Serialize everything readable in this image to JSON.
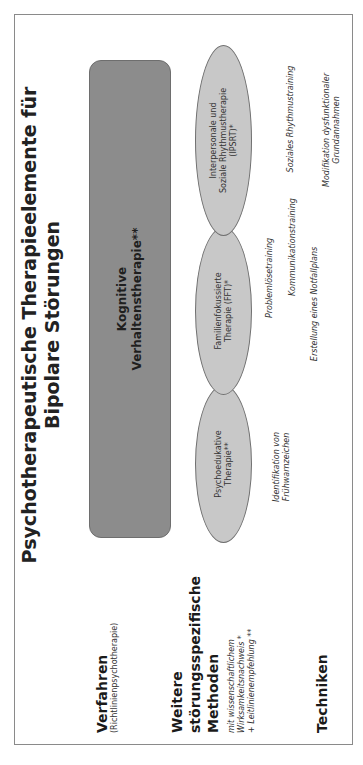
{
  "diagram": {
    "title": "Psychotherapeutische Therapieelemente für Bipolare Störungen",
    "title_lines": [
      "Psychotherapeutische Therapieelemente für",
      "Bipolare Störungen"
    ],
    "orientation": "rotated -90deg",
    "colors": {
      "frame_border": "#8a8a8a",
      "kvt_box_fill": "#8c8c8c",
      "ellipse_fill": "#c8c8c8",
      "ellipse_border": "#707070",
      "background": "#ffffff"
    },
    "row_labels": {
      "verfahren": {
        "label": "Verfahren",
        "sublabel": "(Richtlinienpsychotherapie)"
      },
      "methoden": {
        "label_lines": [
          "Weitere",
          "störungsspezifische",
          "Methoden"
        ],
        "sublabel_lines": [
          "mit wissenschaftlichem",
          "Wirksamkeitsnachweis *",
          "+ Leitlinienempfehlung **"
        ]
      },
      "techniken": {
        "label": "Techniken"
      }
    },
    "verfahren_box": {
      "lines": [
        "Kognitive",
        "Verhaltenstherapie**"
      ]
    },
    "methods": [
      {
        "id": "psychoedukative",
        "lines": [
          "Psychoedukative",
          "Therapie**"
        ]
      },
      {
        "id": "fft",
        "lines": [
          "Familienfokussierte",
          "Therapie (FFT)*"
        ]
      },
      {
        "id": "ipsrt",
        "lines": [
          "Interpersonale und",
          "Soziale Rhythmustherapie",
          "(IPSRT)*"
        ]
      }
    ],
    "techniques": [
      {
        "id": "identifikation",
        "lines": [
          "Identifikation von",
          "Frühwarnzeichen"
        ]
      },
      {
        "id": "problemloese",
        "lines": [
          "Problemlösetraining"
        ]
      },
      {
        "id": "kommunikation",
        "lines": [
          "Kommunikationstraining"
        ]
      },
      {
        "id": "notfallplan",
        "lines": [
          "Erstellung eines Notfallplans"
        ]
      },
      {
        "id": "sozialrhythmus",
        "lines": [
          "Soziales Rhythmustraining"
        ]
      },
      {
        "id": "modifikation",
        "lines": [
          "Modifikation dysfunktionaler",
          "Grundannahmen"
        ]
      }
    ]
  }
}
